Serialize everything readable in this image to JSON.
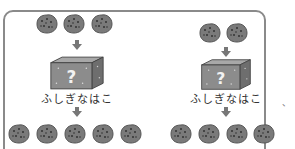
{
  "diagram": {
    "left": {
      "input_count": 3,
      "box_label": "ふしぎなはこ",
      "box_symbol": "?",
      "output_count": 5
    },
    "right": {
      "input_count": 2,
      "box_label": "ふしぎなはこ",
      "box_symbol": "?",
      "output_count": 4
    },
    "side_mark": "、",
    "colors": {
      "cookie": "#7a7a7a",
      "box_front": "#8c8c8c",
      "box_side": "#6e6e6e",
      "box_top": "#a8a8a8",
      "arrow": "#777777",
      "frame": "#8a8a8a"
    }
  }
}
